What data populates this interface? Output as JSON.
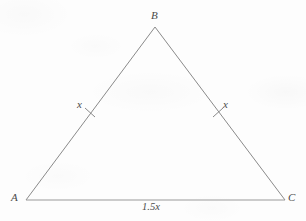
{
  "figure": {
    "kind": "geometry-diagram",
    "shape": "isosceles-triangle",
    "background_color": "#fdfdfd",
    "stroke_color": "#8a8a8a",
    "text_color": "#4a4a4a"
  },
  "vertices": {
    "a": {
      "label": "A",
      "x": 26,
      "y": 200
    },
    "b": {
      "label": "B",
      "x": 155,
      "y": 27
    },
    "c": {
      "label": "C",
      "x": 285,
      "y": 200
    }
  },
  "sides": {
    "ab": {
      "label": "x",
      "tick_marks": 1
    },
    "bc": {
      "label": "x",
      "tick_marks": 1
    },
    "ac": {
      "label": "1.5x",
      "tick_marks": 0
    }
  }
}
